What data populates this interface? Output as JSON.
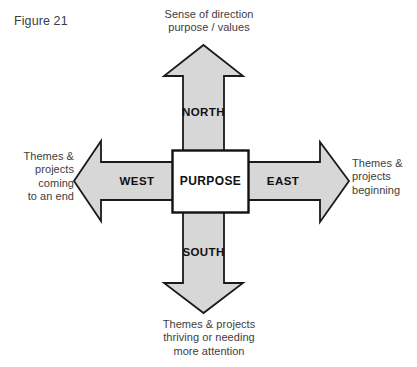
{
  "figure": {
    "label": "Figure 21"
  },
  "colors": {
    "arrow_fill": "#d7d7d7",
    "arrow_stroke": "#1a1a1a",
    "hub_fill": "#ffffff",
    "hub_stroke": "#111111",
    "text": "#3d3d3d",
    "background": "#ffffff"
  },
  "diagram": {
    "type": "compass-four-direction",
    "hub": {
      "label": "PURPOSE"
    },
    "directions": {
      "north": {
        "label": "NORTH",
        "caption_lines": [
          "Sense of direction",
          "purpose / values"
        ],
        "caption_align": "center"
      },
      "west": {
        "label": "WEST",
        "caption_lines": [
          "Themes &",
          "projects",
          "coming",
          "to an end"
        ],
        "caption_align": "right"
      },
      "east": {
        "label": "EAST",
        "caption_lines": [
          "Themes &",
          "projects",
          "beginning"
        ],
        "caption_align": "left"
      },
      "south": {
        "label": "SOUTH",
        "caption_lines": [
          "Themes & projects",
          "thriving or needing",
          "more attention"
        ],
        "caption_align": "center"
      }
    }
  }
}
